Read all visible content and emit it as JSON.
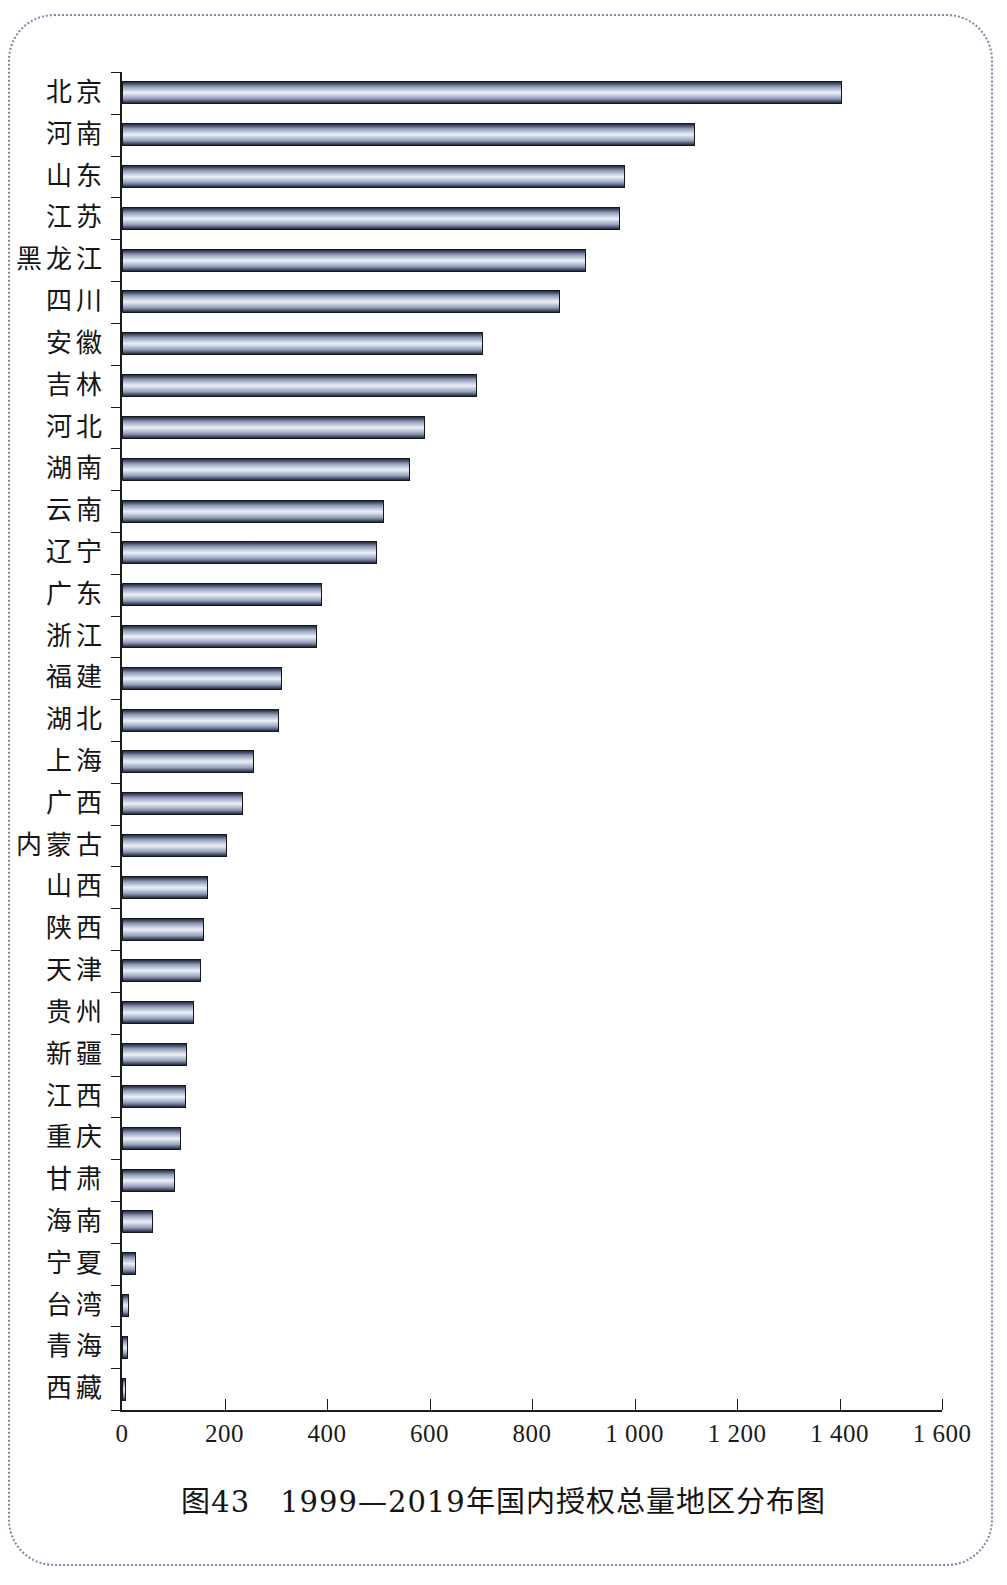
{
  "caption": "图43　1999—2019年国内授权总量地区分布图",
  "axis": {
    "x_tick_labels": [
      "0",
      "200",
      "400",
      "600",
      "800",
      "1 000",
      "1 200",
      "1 400",
      "1 600"
    ],
    "x_tick_values": [
      0,
      200,
      400,
      600,
      800,
      1000,
      1200,
      1400,
      1600
    ],
    "xmin": 0,
    "xmax": 1600
  },
  "chart_data": {
    "type": "bar",
    "orientation": "horizontal",
    "title": "图43　1999—2019年国内授权总量地区分布图",
    "xlabel": "",
    "ylabel": "",
    "xlim": [
      0,
      1600
    ],
    "grid": false,
    "legend": "none",
    "categories": [
      "北京",
      "河南",
      "山东",
      "江苏",
      "黑龙江",
      "四川",
      "安徽",
      "吉林",
      "河北",
      "湖南",
      "云南",
      "辽宁",
      "广东",
      "浙江",
      "福建",
      "湖北",
      "上海",
      "广西",
      "内蒙古",
      "山西",
      "陕西",
      "天津",
      "贵州",
      "新疆",
      "江西",
      "重庆",
      "甘肃",
      "海南",
      "宁夏",
      "台湾",
      "青海",
      "西藏"
    ],
    "values": [
      1405,
      1118,
      982,
      972,
      905,
      855,
      705,
      692,
      592,
      562,
      512,
      498,
      390,
      380,
      312,
      306,
      258,
      236,
      204,
      168,
      160,
      154,
      140,
      126,
      124,
      116,
      104,
      60,
      28,
      14,
      12,
      6
    ],
    "tick_labels_x": [
      "0",
      "200",
      "400",
      "600",
      "800",
      "1 000",
      "1 200",
      "1 400",
      "1 600"
    ]
  }
}
